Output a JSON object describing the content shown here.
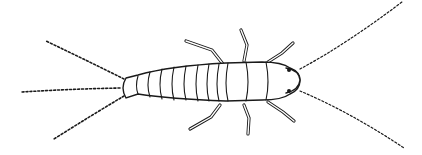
{
  "figure": {
    "colors": {
      "ink": "#1a1a1a",
      "background": "#ffffff"
    }
  }
}
